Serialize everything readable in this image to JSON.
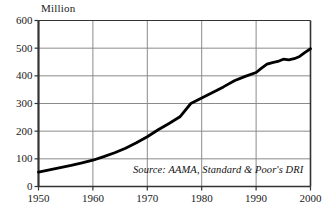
{
  "chart_data": {
    "type": "line",
    "title": "",
    "unit_label": "Million",
    "xlabel": "",
    "ylabel": "Million",
    "xlim": [
      1950,
      2000
    ],
    "ylim": [
      0,
      600
    ],
    "grid": true,
    "legend": false,
    "source_note": "Source: AAMA, Standard & Poor's DRI",
    "y_ticks": [
      0,
      100,
      200,
      300,
      400,
      500,
      600
    ],
    "y_tick_labels": [
      "0",
      "100",
      "200",
      "300",
      "400",
      "500",
      "600"
    ],
    "x_ticks": [
      1950,
      1960,
      1970,
      1980,
      1990,
      2000
    ],
    "x_tick_labels": [
      "1950",
      "1960",
      "1970",
      "1980",
      "1990",
      "2000"
    ],
    "series": [
      {
        "name": "Vehicles in use",
        "color": "#000000",
        "x": [
          1950,
          1952,
          1954,
          1956,
          1958,
          1960,
          1962,
          1964,
          1966,
          1968,
          1970,
          1972,
          1974,
          1976,
          1978,
          1980,
          1982,
          1984,
          1986,
          1988,
          1990,
          1991,
          1992,
          1993,
          1994,
          1995,
          1996,
          1997,
          1998,
          1999,
          2000
        ],
        "values": [
          52,
          60,
          68,
          76,
          85,
          95,
          108,
          122,
          138,
          158,
          180,
          205,
          228,
          252,
          300,
          320,
          340,
          360,
          382,
          398,
          412,
          428,
          442,
          448,
          452,
          460,
          458,
          462,
          470,
          485,
          498
        ]
      }
    ]
  },
  "colors": {
    "line": "#000000",
    "frame": "#333333",
    "gridline": "#8a8a8a",
    "background": "#ffffff",
    "text": "#1a1a1a"
  }
}
